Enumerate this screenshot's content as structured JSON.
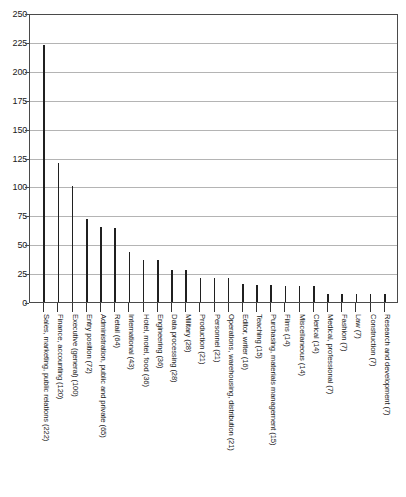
{
  "chart_data": {
    "type": "bar",
    "title": "",
    "subtitle": "",
    "xlabel": "",
    "ylabel": "",
    "ylim": [
      0,
      250
    ],
    "ytick_step": 25,
    "yticks": [
      0,
      25,
      50,
      75,
      100,
      125,
      150,
      175,
      200,
      225,
      250
    ],
    "grid": true,
    "grid_axis": "y",
    "legend": false,
    "legend_position": "none",
    "orientation": "vertical",
    "bar_style": "thin-needle",
    "categories": [
      "Sales, marketing, public relations (222)",
      "Finance, accounting (120)",
      "Executive (general) (100)",
      "Entry position (72)",
      "Administration, public and private (65)",
      "Retail (64)",
      "International (43)",
      "Hotel, motel, food (36)",
      "Engineering (36)",
      "Data processing (28)",
      "Military (28)",
      "Production (21)",
      "Personnel (21)",
      "Operations, warehousing, distribution (21)",
      "Editor, writer (16)",
      "Teaching (15)",
      "Purchasing, materials management (15)",
      "Films (14)",
      "Miscellaneous (14)",
      "Clerical (14)",
      "Medical, professional (7)",
      "Fashion (7)",
      "Law (7)",
      "Construction (7)",
      "Research and development (7)"
    ],
    "values": [
      222,
      120,
      100,
      72,
      65,
      64,
      43,
      36,
      36,
      28,
      28,
      21,
      21,
      21,
      16,
      15,
      15,
      14,
      14,
      14,
      7,
      7,
      7,
      7,
      7
    ],
    "colors": {
      "bar": "#202020",
      "gridline": "#b4b4b4",
      "axis": "#4a4a4a",
      "background": "#ffffff",
      "text": "#1a1a1a"
    }
  }
}
